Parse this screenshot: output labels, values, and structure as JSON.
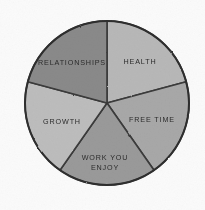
{
  "chart_data": {
    "type": "pie",
    "title": "",
    "subtitle": "",
    "xlabel": "",
    "ylabel": "",
    "legend": "none",
    "grid": false,
    "style": "hand-drawn pencil sketch, greyscale shading",
    "background_color": "#fbfbfb",
    "outline_color": "#2e2e2e",
    "center": {
      "x": 107,
      "y": 103
    },
    "radius": 82,
    "total_degrees": 360,
    "categories": [
      "HEALTH",
      "FREE TIME",
      "WORK YOU ENJOY",
      "GROWTH",
      "RELATIONSHIPS"
    ],
    "values": [
      75,
      70,
      70,
      70,
      75
    ],
    "slices": [
      {
        "label": "HEALTH",
        "label_lines": [
          "HEALTH"
        ],
        "value": 75,
        "start_angle": 0,
        "end_angle": 75,
        "color": "#b8b8b8",
        "label_x": 140,
        "label_y": 62
      },
      {
        "label": "FREE TIME",
        "label_lines": [
          "FREE TIME"
        ],
        "value": 70,
        "start_angle": 75,
        "end_angle": 145,
        "color": "#a8a8a8",
        "label_x": 152,
        "label_y": 120
      },
      {
        "label": "WORK YOU ENJOY",
        "label_lines": [
          "WORK YOU",
          "ENJOY"
        ],
        "value": 70,
        "start_angle": 145,
        "end_angle": 215,
        "color": "#9a9a9a",
        "label_x": 105,
        "label_y": 163
      },
      {
        "label": "GROWTH",
        "label_lines": [
          "GROWTH"
        ],
        "value": 70,
        "start_angle": 215,
        "end_angle": 285,
        "color": "#bdbdbd",
        "label_x": 62,
        "label_y": 122
      },
      {
        "label": "RELATIONSHIPS",
        "label_lines": [
          "RELATIONSHIPS"
        ],
        "value": 75,
        "start_angle": 285,
        "end_angle": 360,
        "color": "#8a8a8a",
        "label_x": 72,
        "label_y": 63
      }
    ]
  }
}
